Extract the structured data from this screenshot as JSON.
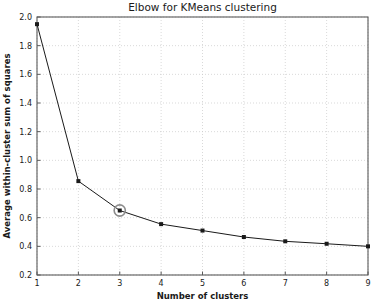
{
  "chart_data": {
    "type": "line",
    "title": "Elbow for KMeans clustering",
    "xlabel": "Number of clusters",
    "ylabel": "Average within-cluster sum of squares",
    "x": [
      1,
      2,
      3,
      4,
      5,
      6,
      7,
      8,
      9
    ],
    "values": [
      1.95,
      0.855,
      0.65,
      0.555,
      0.51,
      0.465,
      0.435,
      0.418,
      0.4
    ],
    "xlim": [
      1,
      9
    ],
    "ylim": [
      0.2,
      2.0
    ],
    "xticks": [
      "1",
      "2",
      "3",
      "4",
      "5",
      "6",
      "7",
      "8",
      "9"
    ],
    "yticks": [
      "0.2",
      "0.4",
      "0.6",
      "0.8",
      "1.0",
      "1.2",
      "1.4",
      "1.6",
      "1.8",
      "2.0"
    ],
    "grid": true,
    "legend": "none",
    "marker": "square",
    "line_color": "#1a1a1a",
    "grid_color": "#c8c8c8",
    "annotations": [
      {
        "name": "elbow-highlight",
        "x": 3,
        "y": 0.65,
        "shape": "open-circle",
        "color": "#8c8c8c"
      }
    ]
  }
}
